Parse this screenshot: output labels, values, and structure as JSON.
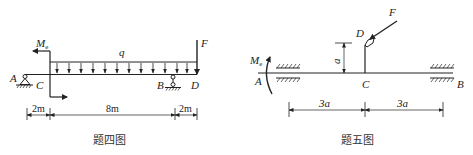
{
  "figures": [
    {
      "caption": "题四图",
      "labels": {
        "A": "A",
        "B": "B",
        "C": "C",
        "D": "D",
        "F": "F",
        "q": "q",
        "Me_main": "M",
        "Me_sub": "e"
      },
      "dimensions": [
        "2m",
        "8m",
        "2m"
      ]
    },
    {
      "caption": "题五图",
      "labels": {
        "A": "A",
        "B": "B",
        "C": "C",
        "D": "D",
        "F": "F",
        "a": "a",
        "Me_main": "M",
        "Me_sub": "e"
      },
      "dimensions": [
        "3a",
        "3a"
      ]
    }
  ],
  "colors": {
    "ink": "#222222",
    "background": "#ffffff"
  }
}
